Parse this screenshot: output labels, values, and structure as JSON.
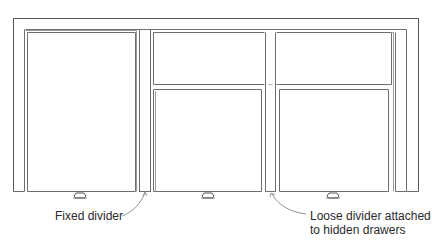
{
  "diagram": {
    "labels": {
      "fixed_divider": "Fixed divider",
      "loose_divider_line1": "Loose divider attached",
      "loose_divider_line2": "to hidden drawers"
    },
    "components": [
      {
        "name": "outer-frame"
      },
      {
        "name": "left-door"
      },
      {
        "name": "fixed-divider"
      },
      {
        "name": "middle-top-drawer"
      },
      {
        "name": "middle-lower-door"
      },
      {
        "name": "loose-divider"
      },
      {
        "name": "right-top-drawer"
      },
      {
        "name": "right-lower-door"
      },
      {
        "name": "left-knob"
      },
      {
        "name": "middle-knob"
      },
      {
        "name": "right-knob"
      }
    ],
    "colors": {
      "line": "#6e6e6e",
      "text": "#2a2a2a",
      "background": "#ffffff"
    }
  }
}
